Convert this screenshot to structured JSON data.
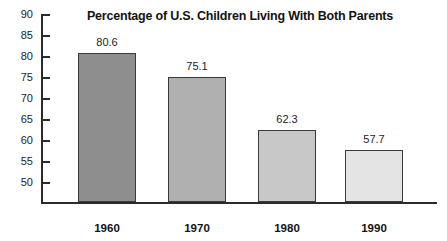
{
  "chart_data": {
    "type": "bar",
    "title": "Percentage of U.S. Children Living With Both Parents",
    "xlabel": "",
    "ylabel": "",
    "categories": [
      "1960",
      "1970",
      "1980",
      "1990"
    ],
    "values": [
      80.6,
      75.1,
      62.3,
      57.7
    ],
    "value_labels": [
      "80.6",
      "75.1",
      "62.3",
      "57.7"
    ],
    "ylim": [
      46,
      90
    ],
    "yticks": [
      90,
      85,
      80,
      75,
      70,
      65,
      60,
      55,
      50
    ],
    "ytick_labels": [
      "90",
      "85",
      "80",
      "75",
      "70",
      "65",
      "60",
      "55",
      "50"
    ],
    "grid": false,
    "legend": null,
    "bar_colors": [
      "#8e8e8e",
      "#b0b0b0",
      "#c8c8c8",
      "#e4e4e4"
    ],
    "bar_edge_color": "#3a3a3a",
    "axis_color": "#2b2b2b",
    "background": "#ffffff"
  }
}
